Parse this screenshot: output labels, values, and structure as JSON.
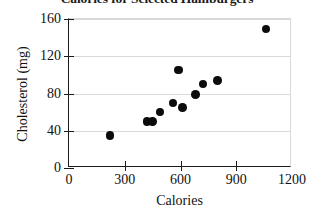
{
  "chart_data": {
    "type": "scatter",
    "title": "Calories for Selected Hamburgers",
    "xlabel": "Calories",
    "ylabel": "Cholesterol (mg)",
    "xlim": [
      0,
      1200
    ],
    "ylim": [
      0,
      160
    ],
    "xticks": [
      0,
      300,
      600,
      900,
      1200
    ],
    "yticks": [
      0,
      40,
      80,
      120,
      160
    ],
    "xtick_labels": [
      "0",
      "300",
      "600",
      "900",
      "1200"
    ],
    "ytick_labels": [
      "0",
      "40",
      "80",
      "120",
      "160"
    ],
    "grid": true,
    "grid_axis": "y",
    "legend": false,
    "marker": "filled-circle",
    "marker_color": "#0c0c0c",
    "points": [
      {
        "x": 220,
        "y": 35
      },
      {
        "x": 420,
        "y": 50
      },
      {
        "x": 450,
        "y": 50
      },
      {
        "x": 490,
        "y": 60
      },
      {
        "x": 560,
        "y": 70
      },
      {
        "x": 590,
        "y": 105
      },
      {
        "x": 610,
        "y": 65
      },
      {
        "x": 680,
        "y": 79
      },
      {
        "x": 720,
        "y": 90
      },
      {
        "x": 800,
        "y": 94
      },
      {
        "x": 1060,
        "y": 149
      }
    ]
  }
}
